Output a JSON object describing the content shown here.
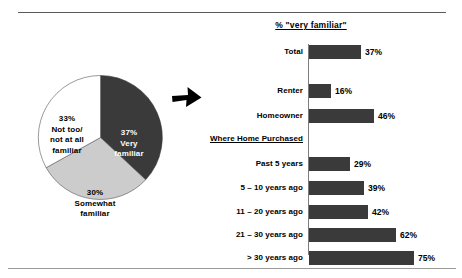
{
  "chart_data": [
    {
      "type": "pie",
      "title": "",
      "categories": [
        "Very familiar",
        "Somewhat familiar",
        "Not too/ not at all familiar"
      ],
      "values": [
        37,
        30,
        33
      ],
      "labels": [
        "37% Very familiar",
        "30% Somewhat familiar",
        "33% Not too/ not at all familiar"
      ],
      "colors": [
        "#3a3a3a",
        "#cccccc",
        "#ffffff"
      ],
      "legend": "none",
      "slices": [
        {
          "label_lines": [
            "37%",
            "Very",
            "familiar"
          ],
          "value": 37,
          "value_text": "37%",
          "color": "#3a3a3a",
          "text_color": "#ffffff"
        },
        {
          "label_lines": [
            "30%",
            "Somewhat",
            "familiar"
          ],
          "value": 30,
          "value_text": "30%",
          "color": "#cccccc",
          "text_color": "#000000"
        },
        {
          "label_lines": [
            "33%",
            "Not too/",
            "not at all",
            "familiar"
          ],
          "value": 33,
          "value_text": "33%",
          "color": "#ffffff",
          "text_color": "#000000"
        }
      ]
    },
    {
      "type": "bar",
      "orientation": "horizontal",
      "title": "% \"very familiar\"",
      "xlabel": "",
      "ylabel": "",
      "xlim": [
        0,
        80
      ],
      "grid": false,
      "legend": "none",
      "bar_color": "#3a3a3a",
      "categories": [
        "Total",
        "Renter",
        "Homeowner",
        "Past 5 years",
        "5 – 10 years ago",
        "11 – 20 years ago",
        "21 – 30 years ago",
        "> 30 years ago"
      ],
      "values": [
        37,
        16,
        46,
        29,
        39,
        42,
        62,
        75
      ],
      "value_labels": [
        "37%",
        "16%",
        "46%",
        "29%",
        "39%",
        "42%",
        "62%",
        "75%"
      ],
      "group_headers": [
        {
          "label": "Where Home Purchased",
          "before_category": "Past 5 years"
        }
      ],
      "rows": [
        {
          "category": "Total",
          "value": 37,
          "value_text": "37%",
          "top": 31
        },
        {
          "category": "Renter",
          "value": 16,
          "value_text": "16%",
          "top": 70
        },
        {
          "category": "Homeowner",
          "value": 46,
          "value_text": "46%",
          "top": 95
        },
        {
          "category": "Past 5 years",
          "value": 29,
          "value_text": "29%",
          "top": 143
        },
        {
          "category": "5 – 10 years ago",
          "value": 39,
          "value_text": "39%",
          "top": 167
        },
        {
          "category": "11 – 20 years ago",
          "value": 42,
          "value_text": "42%",
          "top": 191
        },
        {
          "category": "21 – 30 years ago",
          "value": 62,
          "value_text": "62%",
          "top": 214
        },
        {
          "category": "> 30 years ago",
          "value": 75,
          "value_text": "75%",
          "top": 237
        }
      ],
      "group_header": {
        "label": "Where Home Purchased",
        "top": 120
      }
    }
  ],
  "pie": {
    "very": {
      "pct": "37%",
      "l1": "Very",
      "l2": "familiar"
    },
    "somewhat": {
      "pct": "30%",
      "l1": "Somewhat",
      "l2": "familiar"
    },
    "nottoo": {
      "pct": "33%",
      "l1": "Not too/",
      "l2": "not at all",
      "l3": "familiar"
    }
  },
  "bars": {
    "title": "% \"very familiar\"",
    "group_header": "Where Home Purchased",
    "rows": [
      {
        "category": "Total",
        "value_text": "37%"
      },
      {
        "category": "Renter",
        "value_text": "16%"
      },
      {
        "category": "Homeowner",
        "value_text": "46%"
      },
      {
        "category": "Past 5 years",
        "value_text": "29%"
      },
      {
        "category": "5 – 10 years ago",
        "value_text": "39%"
      },
      {
        "category": "11 – 20 years ago",
        "value_text": "42%"
      },
      {
        "category": "21 – 30 years ago",
        "value_text": "62%"
      },
      {
        "category": "> 30 years ago",
        "value_text": "75%"
      }
    ]
  }
}
